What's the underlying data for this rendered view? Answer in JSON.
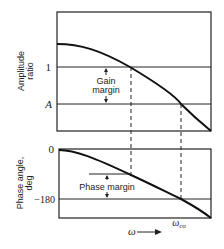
{
  "figure": {
    "top_panel": {
      "ylabel_line1": "Amplitude",
      "ylabel_line2": "ratio",
      "ref_lines": [
        {
          "name": "unity",
          "label": "1"
        },
        {
          "name": "A",
          "label": "A"
        }
      ],
      "annotation_line1": "Gain",
      "annotation_line2": "margin"
    },
    "bottom_panel": {
      "ylabel_line1": "Phase angle,",
      "ylabel_line2": "deg",
      "ref_lines": [
        {
          "name": "zero",
          "label": "0"
        },
        {
          "name": "minus180",
          "label": "−180"
        }
      ],
      "annotation": "Phase margin"
    },
    "x_axis": {
      "label": "ω",
      "arrow": "——▸",
      "crossover_label": "ω",
      "crossover_subscript": "co"
    },
    "colors": {
      "ink": "#222222",
      "background": "#ffffff"
    }
  }
}
